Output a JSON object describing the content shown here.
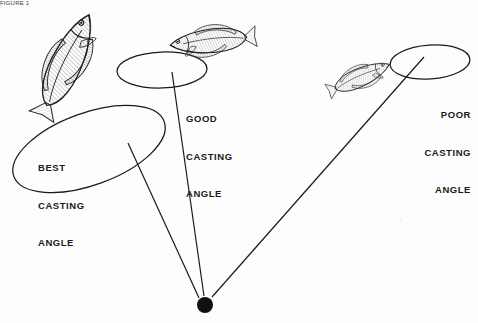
{
  "figure": {
    "cut_caption": "FIGURE 1",
    "background_color": "#fdfdfd",
    "ink_color": "#1a1a1a"
  },
  "labels": {
    "best": {
      "line1": "BEST",
      "line2": "CASTING",
      "line3": "ANGLE"
    },
    "good": {
      "line1": "GOOD",
      "line2": "CASTING",
      "line3": "ANGLE"
    },
    "poor": {
      "line1": "POOR",
      "line2": "CASTING",
      "line3": "ANGLE"
    }
  },
  "chart_data": {
    "type": "diagram",
    "origin": {
      "label": "angler-position",
      "x": 205,
      "y": 305,
      "radius": 8,
      "color": "#101010"
    },
    "zones": [
      {
        "name": "BEST CASTING ANGLE",
        "rating": "best",
        "ellipse": {
          "cx": 89,
          "cy": 149,
          "rx": 80,
          "ry": 36,
          "rotation": -20
        },
        "line_from": {
          "x": 128,
          "y": 143
        },
        "line_to": {
          "x": 199,
          "y": 298
        }
      },
      {
        "name": "GOOD CASTING ANGLE",
        "rating": "good",
        "ellipse": {
          "cx": 162,
          "cy": 70,
          "rx": 45,
          "ry": 18,
          "rotation": -2
        },
        "line_from": {
          "x": 172,
          "y": 72
        },
        "line_to": {
          "x": 204,
          "y": 296
        }
      },
      {
        "name": "POOR CASTING ANGLE",
        "rating": "poor",
        "ellipse": {
          "cx": 430,
          "cy": 62,
          "rx": 40,
          "ry": 17,
          "rotation": -4
        },
        "line_from": {
          "x": 424,
          "y": 57
        },
        "line_to": {
          "x": 212,
          "y": 297
        }
      }
    ],
    "fish": [
      {
        "name": "fish-left",
        "cx": 67,
        "cy": 62,
        "length": 104,
        "rotation": -65,
        "zone": "best"
      },
      {
        "name": "fish-middle",
        "cx": 210,
        "cy": 41,
        "length": 80,
        "rotation": -6,
        "zone": "good"
      },
      {
        "name": "fish-right",
        "cx": 361,
        "cy": 77,
        "length": 62,
        "rotation": -24,
        "zone": "poor"
      }
    ]
  }
}
